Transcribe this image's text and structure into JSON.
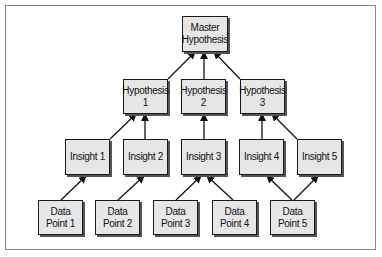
{
  "diagram": {
    "type": "hierarchy",
    "nodes": {
      "master": "Master\nHypothesis",
      "h1": "Hypothesis\n1",
      "h2": "Hypothesis\n2",
      "h3": "Hypothesis\n3",
      "i1": "Insight 1",
      "i2": "Insight 2",
      "i3": "Insight 3",
      "i4": "Insight 4",
      "i5": "Insight 5",
      "d1": "Data\nPoint 1",
      "d2": "Data\nPoint 2",
      "d3": "Data\nPoint 3",
      "d4": "Data\nPoint 4",
      "d5": "Data\nPoint 5"
    },
    "edges": [
      [
        "h1",
        "master"
      ],
      [
        "h2",
        "master"
      ],
      [
        "h3",
        "master"
      ],
      [
        "i1",
        "h1"
      ],
      [
        "i2",
        "h1"
      ],
      [
        "i3",
        "h2"
      ],
      [
        "i4",
        "h3"
      ],
      [
        "i5",
        "h3"
      ],
      [
        "d1",
        "i1"
      ],
      [
        "d2",
        "i2"
      ],
      [
        "d3",
        "i3"
      ],
      [
        "d4",
        "i3"
      ],
      [
        "d5",
        "i4"
      ],
      [
        "d5",
        "i5"
      ]
    ],
    "colors": {
      "node_fill": "#e6e6e6",
      "border": "#1a1a1a",
      "frame": "#8a8a8a"
    }
  }
}
